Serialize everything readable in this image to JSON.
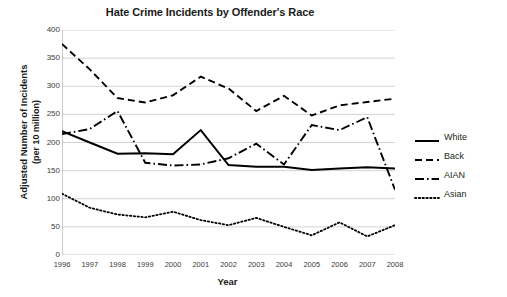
{
  "chart_data": {
    "type": "line",
    "title": "Hate Crime Incidents by Offender's Race",
    "xlabel": "Year",
    "ylabel": "Adjusted Number of Incidents",
    "ylabel_line2": "(per 10 million)",
    "x": [
      1996,
      1997,
      1998,
      1999,
      2000,
      2001,
      2002,
      2003,
      2004,
      2005,
      2006,
      2007,
      2008
    ],
    "categories": [
      "1996",
      "1997",
      "1998",
      "1999",
      "2000",
      "2001",
      "2002",
      "2003",
      "2004",
      "2005",
      "2006",
      "2007",
      "2008"
    ],
    "xlim": [
      1996,
      2008
    ],
    "ylim": [
      0,
      400
    ],
    "yticks": [
      0,
      50,
      100,
      150,
      200,
      250,
      300,
      350,
      400
    ],
    "ytick_labels": [
      "0",
      "50",
      "100",
      "150",
      "200",
      "250",
      "300",
      "350",
      "400"
    ],
    "grid": "horizontal",
    "legend_position": "right",
    "series": [
      {
        "name": "White",
        "style": "solid",
        "color": "#000000",
        "values": [
          220,
          200,
          180,
          181,
          179,
          222,
          160,
          157,
          157,
          151,
          154,
          156,
          154
        ]
      },
      {
        "name": "Back",
        "style": "dashed",
        "color": "#000000",
        "values": [
          375,
          330,
          279,
          271,
          284,
          317,
          296,
          256,
          283,
          248,
          266,
          272,
          278
        ]
      },
      {
        "name": "AIAN",
        "style": "dash-dot",
        "color": "#000000",
        "values": [
          215,
          224,
          256,
          164,
          159,
          161,
          172,
          198,
          161,
          231,
          222,
          245,
          116
        ]
      },
      {
        "name": "Asian",
        "style": "dotted",
        "color": "#000000",
        "values": [
          109,
          84,
          72,
          67,
          77,
          62,
          53,
          66,
          50,
          35,
          58,
          33,
          53
        ]
      }
    ]
  }
}
